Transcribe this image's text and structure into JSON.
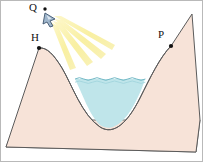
{
  "figure": {
    "background_color": "#ffffff",
    "width": 203,
    "height": 162,
    "labels": [
      {
        "id": "Q",
        "text": "Q",
        "role": "light-source-point",
        "x": 36,
        "y": 8
      },
      {
        "id": "H",
        "text": "H",
        "role": "left-hill-summit-point",
        "x": 36,
        "y": 44
      },
      {
        "id": "P",
        "text": "P",
        "role": "right-slope-point",
        "x": 169,
        "y": 42
      }
    ],
    "colors": {
      "land_fill": "#f7e3d8",
      "land_stroke": "#5b5b5b",
      "water_fill": "#bfe5ea",
      "water_stroke": "#8fc9d4",
      "ray_color": "#f7eb90",
      "ray_color_bright": "#faf3b8",
      "marker_color": "#111111",
      "lamp_body": "#9fb6cc",
      "lamp_stroke": "#40566e",
      "label_color": "#111111",
      "border_color": "#8a8a8a"
    },
    "elements": {
      "ground_plane": "base-parallelogram",
      "left_hill": "left-hill-slope",
      "right_hill": "right-hill-slope",
      "valley": "u-shaped-valley",
      "water_body": "lake-in-valley",
      "water_surface": "wavy-waterline",
      "light_rays_count": 4,
      "lamp": "spotlight-emitter"
    },
    "markers": [
      {
        "id": "Q-dot",
        "x": 45,
        "y": 9
      },
      {
        "id": "H-dot",
        "x": 39,
        "y": 48
      },
      {
        "id": "P-dot",
        "x": 171,
        "y": 46
      }
    ]
  }
}
